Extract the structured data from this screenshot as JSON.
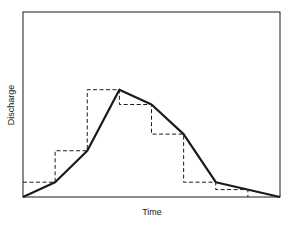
{
  "chart_data": {
    "type": "line",
    "title": "",
    "xlabel": "Time",
    "ylabel": "Discharge",
    "grid": false,
    "legend": null,
    "xlim": [
      0,
      8
    ],
    "ylim": [
      0,
      100
    ],
    "series": [
      {
        "name": "Hydrograph (continuous)",
        "style": "solid",
        "x": [
          0,
          1,
          2,
          3,
          4,
          5,
          6,
          8
        ],
        "values": [
          0,
          8,
          25,
          58,
          50,
          34,
          8,
          0
        ]
      },
      {
        "name": "Stepped (interval-averaged) hydrograph",
        "style": "dashed",
        "step_edges": [
          0,
          1,
          2,
          3,
          4,
          5,
          6,
          7
        ],
        "values": [
          8,
          25,
          58,
          50,
          34,
          8,
          4
        ]
      }
    ]
  },
  "labels": {
    "x": "Time",
    "y": "Discharge"
  },
  "colors": {
    "line": "#1a1a1a",
    "background": "#ffffff"
  }
}
